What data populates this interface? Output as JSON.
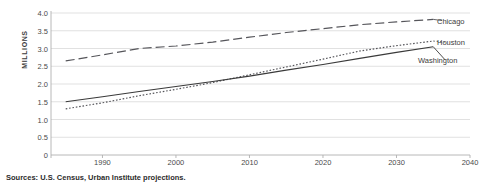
{
  "chart_data": {
    "type": "line",
    "title": "",
    "ylabel": "MILLIONS",
    "xlabel": "",
    "ylim": [
      0,
      4.0
    ],
    "xlim": [
      1983,
      2040
    ],
    "grid": true,
    "legend_position": "right-inline",
    "ytick_labels": [
      "4.0",
      "3.5",
      "3.0",
      "2.5",
      "2.0",
      "1.5",
      "1.0",
      "0.5",
      "0"
    ],
    "ytick_values": [
      4.0,
      3.5,
      3.0,
      2.5,
      2.0,
      1.5,
      1.0,
      0.5,
      0
    ],
    "xtick_labels": [
      "1990",
      "2000",
      "2010",
      "2020",
      "2030",
      "2040"
    ],
    "xtick_values": [
      1990,
      2000,
      2010,
      2020,
      2030,
      2040
    ],
    "series": [
      {
        "name": "Chicago",
        "style": "long-dash",
        "color": "#55555a",
        "x": [
          1985,
          1990,
          1995,
          2000,
          2005,
          2010,
          2015,
          2020,
          2025,
          2030,
          2035
        ],
        "values": [
          2.65,
          2.82,
          3.0,
          3.07,
          3.18,
          3.32,
          3.45,
          3.56,
          3.67,
          3.75,
          3.82
        ]
      },
      {
        "name": "Houston",
        "style": "dotted",
        "color": "#55555a",
        "x": [
          1985,
          1990,
          1995,
          2000,
          2005,
          2010,
          2015,
          2020,
          2025,
          2030,
          2035
        ],
        "values": [
          1.3,
          1.47,
          1.67,
          1.85,
          2.04,
          2.26,
          2.48,
          2.7,
          2.93,
          3.08,
          3.21
        ]
      },
      {
        "name": "Washington",
        "style": "solid",
        "color": "#3a3a3a",
        "x": [
          1985,
          1990,
          1995,
          2000,
          2005,
          2010,
          2015,
          2020,
          2025,
          2030,
          2035
        ],
        "values": [
          1.5,
          1.64,
          1.79,
          1.93,
          2.07,
          2.22,
          2.39,
          2.55,
          2.72,
          2.89,
          3.05
        ]
      }
    ],
    "annotations": [
      "Sources: U.S. Census, Urban Institute projections."
    ]
  },
  "source": {
    "note": "Sources: U.S. Census, Urban Institute projections."
  },
  "colors": {
    "grid": "#d9d9d9",
    "axis": "#b0b0b0",
    "text": "#3b3b3b",
    "chicago": "#55555a",
    "houston": "#55555a",
    "washington": "#3a3a3a"
  }
}
